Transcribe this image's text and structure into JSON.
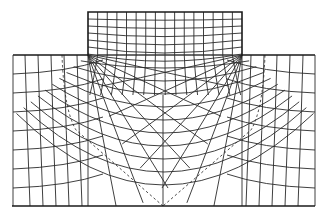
{
  "diagram": {
    "title": "",
    "type": "orthogonal flow-net grid (slip-line field)",
    "colors": {
      "lines": "#2a2a2a",
      "background": "#ffffff"
    },
    "elements": [
      "upper-block-grid",
      "lower-region-grid",
      "dashed-boundary-lines",
      "base-line"
    ]
  }
}
